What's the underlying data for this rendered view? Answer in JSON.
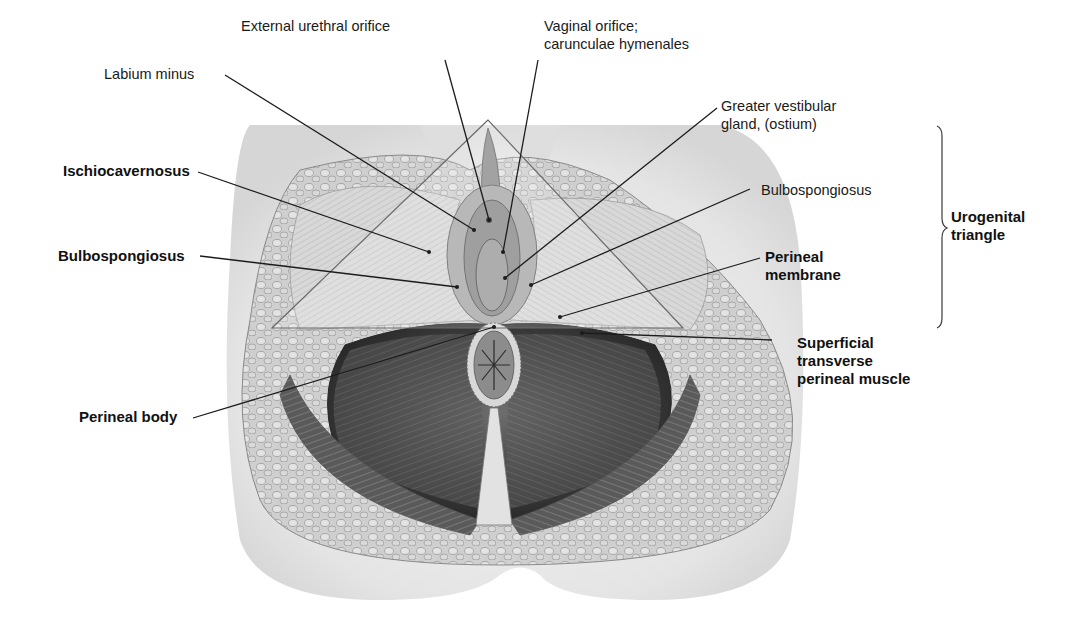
{
  "figure": {
    "type": "anatomical-illustration"
  },
  "labels": {
    "external_urethral_orifice": {
      "text": "External urethral orifice",
      "bold": false
    },
    "labium_minus": {
      "text": "Labium minus",
      "bold": false
    },
    "vaginal_orifice": {
      "line1": "Vaginal orifice;",
      "line2": "carunculae hymenales",
      "bold": false
    },
    "greater_vestibular_gland": {
      "line1": "Greater vestibular",
      "line2": "gland, (ostium)",
      "bold": false
    },
    "ischiocavernosus": {
      "text": "Ischiocavernosus",
      "bold": true
    },
    "bulbospongiosus_left": {
      "text": "Bulbospongiosus",
      "bold": true
    },
    "bulbospongiosus_right": {
      "text": "Bulbospongiosus",
      "bold": false
    },
    "perineal_membrane": {
      "line1": "Perineal",
      "line2": "membrane",
      "bold": true
    },
    "superficial_transverse": {
      "line1": "Superficial",
      "line2": "transverse",
      "line3": "perineal muscle",
      "bold": true
    },
    "perineal_body": {
      "text": "Perineal body",
      "bold": true
    }
  },
  "bracket": {
    "label_line1": "Urogenital",
    "label_line2": "triangle",
    "bold": true
  },
  "colors": {
    "background": "#ffffff",
    "skin": "#e9e9e9",
    "fat": "#bdbdbd",
    "muscle_dark": "#4a4a4a",
    "muscle_mid": "#8a8a8a",
    "text": "#1a1a1a"
  }
}
